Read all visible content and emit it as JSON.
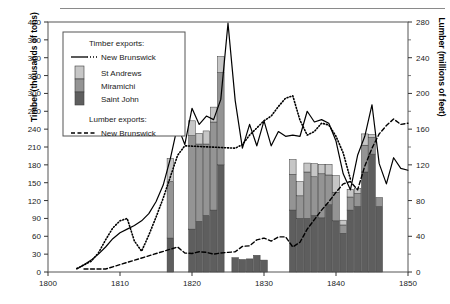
{
  "figure": {
    "kind": "statistical-figure",
    "has_top_rule": true
  },
  "chart_data": {
    "type": "bar",
    "title": "",
    "subtitle": "",
    "xlabel": "",
    "ylabel": "Timber (thousands of tons)",
    "ylabel_right": "Lumber (millions of feet)",
    "xlim": [
      1800,
      1850
    ],
    "ylim": [
      0,
      420
    ],
    "ylim_right": [
      0,
      280
    ],
    "xticks": [
      1800,
      1810,
      1820,
      1830,
      1840,
      1850
    ],
    "xtick_labels": [
      "1800",
      "1810",
      "1820",
      "1830",
      "1840",
      "1850"
    ],
    "yticks": [
      0,
      30,
      60,
      90,
      120,
      150,
      180,
      210,
      240,
      270,
      300,
      330,
      360,
      390,
      420
    ],
    "ytick_labels": [
      "0",
      "30",
      "60",
      "90",
      "120",
      "150",
      "180",
      "210",
      "240",
      "270",
      "300",
      "330",
      "360",
      "390",
      "420"
    ],
    "yticks_right": [
      0,
      40,
      80,
      120,
      160,
      200,
      240,
      280
    ],
    "ytick_labels_right": [
      "0",
      "40",
      "80",
      "120",
      "160",
      "200",
      "240",
      "280"
    ],
    "yticks_right_minor": [
      20,
      60,
      100,
      140,
      180,
      220,
      260
    ],
    "grid": false,
    "legend_position": "upper-left",
    "stacked": true,
    "categories": [
      1817,
      1818,
      1820,
      1821,
      1822,
      1823,
      1824,
      1825,
      1826,
      1827,
      1828,
      1829,
      1830,
      1831,
      1834,
      1835,
      1836,
      1837,
      1838,
      1839,
      1840,
      1841,
      1842,
      1843,
      1844,
      1845,
      1846,
      1847
    ],
    "series": [
      {
        "name": "Saint John",
        "color": "#5e5e5e",
        "axis": "left",
        "values": [
          57,
          0,
          72,
          85,
          95,
          104,
          180,
          0,
          24,
          21,
          22,
          28,
          20,
          0,
          104,
          90,
          90,
          95,
          91,
          113,
          86,
          65,
          104,
          110,
          168,
          198,
          110,
          0
        ]
      },
      {
        "name": "Miramichi",
        "color": "#949494",
        "axis": "left",
        "values": [
          95,
          0,
          157,
          130,
          120,
          148,
          155,
          0,
          0,
          0,
          0,
          0,
          0,
          0,
          60,
          38,
          78,
          65,
          74,
          50,
          48,
          14,
          22,
          22,
          45,
          28,
          15,
          0
        ]
      },
      {
        "name": "St Andrews",
        "color": "#c6c6c6",
        "axis": "left",
        "values": [
          39,
          0,
          25,
          18,
          22,
          25,
          27,
          0,
          0,
          0,
          0,
          0,
          0,
          0,
          25,
          24,
          15,
          22,
          16,
          18,
          28,
          8,
          13,
          8,
          19,
          5,
          0,
          0
        ]
      }
    ],
    "lines": [
      {
        "name": "Timber exports: New Brunswick",
        "style": "solid",
        "axis": "left",
        "color": "#000000",
        "points": [
          [
            1804,
            5
          ],
          [
            1805,
            12
          ],
          [
            1806,
            20
          ],
          [
            1807,
            30
          ],
          [
            1808,
            42
          ],
          [
            1809,
            56
          ],
          [
            1810,
            66
          ],
          [
            1811,
            72
          ],
          [
            1812,
            78
          ],
          [
            1813,
            86
          ],
          [
            1814,
            98
          ],
          [
            1815,
            118
          ],
          [
            1816,
            146
          ],
          [
            1817,
            191
          ],
          [
            1818,
            246
          ],
          [
            1819,
            214
          ],
          [
            1820,
            275
          ],
          [
            1821,
            248
          ],
          [
            1822,
            262
          ],
          [
            1823,
            256
          ],
          [
            1824,
            290
          ],
          [
            1825,
            418
          ],
          [
            1826,
            288
          ],
          [
            1827,
            208
          ],
          [
            1828,
            248
          ],
          [
            1829,
            212
          ],
          [
            1830,
            254
          ],
          [
            1831,
            212
          ],
          [
            1832,
            236
          ],
          [
            1833,
            228
          ],
          [
            1834,
            230
          ],
          [
            1835,
            228
          ],
          [
            1836,
            270
          ],
          [
            1837,
            252
          ],
          [
            1838,
            256
          ],
          [
            1839,
            250
          ],
          [
            1840,
            220
          ],
          [
            1841,
            165
          ],
          [
            1842,
            138
          ],
          [
            1843,
            196
          ],
          [
            1844,
            228
          ],
          [
            1845,
            281
          ],
          [
            1846,
            182
          ],
          [
            1847,
            148
          ],
          [
            1848,
            192
          ],
          [
            1849,
            174
          ],
          [
            1850,
            171
          ]
        ]
      },
      {
        "name": "Timber exports: New Brunswick (dotted segment)",
        "style": "dotted",
        "axis": "left",
        "color": "#000000",
        "points": [
          [
            1804,
            6
          ],
          [
            1806,
            18
          ],
          [
            1807,
            32
          ],
          [
            1808,
            54
          ],
          [
            1809,
            74
          ],
          [
            1810,
            86
          ],
          [
            1811,
            90
          ],
          [
            1812,
            52
          ],
          [
            1813,
            35
          ],
          [
            1814,
            62
          ],
          [
            1815,
            92
          ],
          [
            1816,
            124
          ],
          [
            1817,
            160
          ],
          [
            1818,
            196
          ],
          [
            1819,
            212
          ],
          [
            1826,
            208
          ],
          [
            1827,
            214
          ],
          [
            1828,
            230
          ],
          [
            1829,
            242
          ],
          [
            1830,
            254
          ],
          [
            1831,
            262
          ],
          [
            1832,
            278
          ],
          [
            1833,
            292
          ],
          [
            1834,
            296
          ],
          [
            1835,
            255
          ],
          [
            1836,
            230
          ],
          [
            1837,
            236
          ],
          [
            1838,
            250
          ],
          [
            1839,
            247
          ],
          [
            1840,
            228
          ],
          [
            1841,
            200
          ],
          [
            1842,
            156
          ]
        ]
      },
      {
        "name": "Lumber exports: New Brunswick",
        "style": "dashed",
        "axis": "left",
        "color": "#000000",
        "points": [
          [
            1805,
            5
          ],
          [
            1806,
            5
          ],
          [
            1807,
            5
          ],
          [
            1808,
            5
          ],
          [
            1818,
            42
          ],
          [
            1819,
            32
          ],
          [
            1820,
            31
          ],
          [
            1821,
            34
          ],
          [
            1822,
            33
          ],
          [
            1823,
            30
          ],
          [
            1824,
            32
          ],
          [
            1825,
            33
          ],
          [
            1826,
            34
          ],
          [
            1827,
            43
          ],
          [
            1828,
            44
          ],
          [
            1829,
            54
          ],
          [
            1830,
            57
          ],
          [
            1831,
            52
          ],
          [
            1832,
            59
          ],
          [
            1833,
            59
          ],
          [
            1834,
            42
          ],
          [
            1835,
            50
          ],
          [
            1836,
            72
          ],
          [
            1837,
            88
          ],
          [
            1838,
            104
          ],
          [
            1839,
            118
          ],
          [
            1840,
            134
          ],
          [
            1841,
            148
          ],
          [
            1842,
            152
          ],
          [
            1843,
            138
          ],
          [
            1844,
            178
          ],
          [
            1845,
            208
          ],
          [
            1846,
            232
          ],
          [
            1847,
            246
          ],
          [
            1848,
            257
          ],
          [
            1849,
            248
          ],
          [
            1850,
            250
          ]
        ]
      }
    ],
    "legend": {
      "heading_timber": "Timber exports:",
      "timber_line_label": "New Brunswick",
      "swatches": [
        {
          "label": "St Andrews",
          "color": "#c6c6c6"
        },
        {
          "label": "Miramichi",
          "color": "#949494"
        },
        {
          "label": "Saint John",
          "color": "#5e5e5e"
        }
      ],
      "heading_lumber": "Lumber exports:",
      "lumber_line_label": "New Brunswick"
    }
  }
}
